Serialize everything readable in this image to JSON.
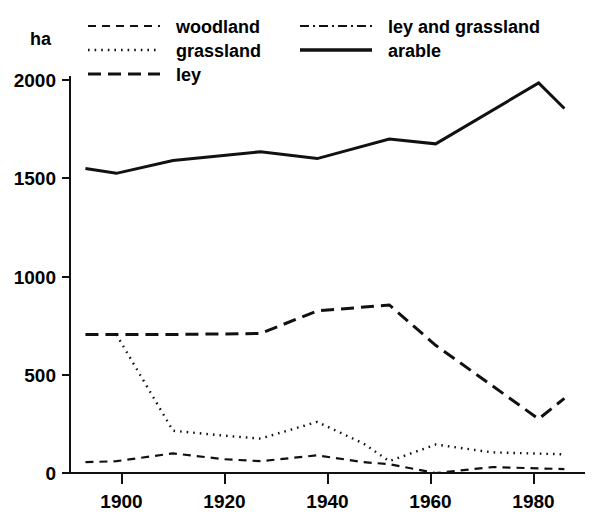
{
  "figure": {
    "y_unit_label": "ha",
    "background_color": "#ffffff",
    "ink_color": "#111111"
  },
  "legend": {
    "position": "top",
    "entries": [
      {
        "key": "woodland",
        "label": "woodland",
        "style": "short-dash",
        "column": 1,
        "row": 1
      },
      {
        "key": "grassland",
        "label": "grassland",
        "style": "dotted",
        "column": 1,
        "row": 2
      },
      {
        "key": "ley",
        "label": "ley",
        "style": "long-dash",
        "column": 1,
        "row": 3
      },
      {
        "key": "ley_and_grassland",
        "label": "ley and grassland",
        "style": "dash-dot",
        "column": 2,
        "row": 1
      },
      {
        "key": "arable",
        "label": "arable",
        "style": "solid",
        "column": 2,
        "row": 2
      }
    ]
  },
  "axes": {
    "y": {
      "label": "ha",
      "ticks": [
        0,
        500,
        1000,
        1500,
        2000
      ],
      "tick_labels": [
        "0",
        "500",
        "1000",
        "1500",
        "2000"
      ],
      "range": [
        0,
        2100
      ]
    },
    "x": {
      "ticks": [
        1900,
        1920,
        1940,
        1960,
        1980
      ],
      "tick_labels": [
        "1900",
        "1920",
        "1940",
        "1960",
        "1980"
      ],
      "range": [
        1890,
        1990
      ]
    },
    "grid": false
  },
  "chart_data": {
    "type": "line",
    "title": "",
    "subtitle": "",
    "xlabel": "",
    "ylabel": "ha",
    "xlim": [
      1890,
      1990
    ],
    "ylim": [
      0,
      2100
    ],
    "grid": false,
    "legend_position": "top",
    "x_tick_labels": [
      "1900",
      "1920",
      "1940",
      "1960",
      "1980"
    ],
    "y_tick_labels": [
      "0",
      "500",
      "1000",
      "1500",
      "2000"
    ],
    "series": [
      {
        "name": "arable",
        "style": "solid",
        "x": [
          1893,
          1899,
          1910,
          1927,
          1938,
          1952,
          1961,
          1981,
          1986
        ],
        "values": [
          1550,
          1525,
          1590,
          1635,
          1600,
          1700,
          1675,
          1985,
          1855
        ]
      },
      {
        "name": "ley",
        "style": "long-dash",
        "x": [
          1893,
          1899,
          1910,
          1927,
          1938,
          1952,
          1961,
          1981,
          1986
        ],
        "values": [
          705,
          705,
          705,
          710,
          825,
          855,
          650,
          275,
          380
        ]
      },
      {
        "name": "grassland",
        "style": "dotted",
        "x": [
          1899,
          1910,
          1920,
          1927,
          1938,
          1947,
          1952,
          1961,
          1972,
          1986
        ],
        "values": [
          705,
          215,
          190,
          175,
          260,
          150,
          60,
          145,
          105,
          95
        ]
      },
      {
        "name": "woodland",
        "style": "short-dash",
        "x": [
          1893,
          1899,
          1910,
          1920,
          1927,
          1938,
          1947,
          1952,
          1961,
          1972,
          1986
        ],
        "values": [
          55,
          60,
          100,
          70,
          60,
          90,
          55,
          45,
          0,
          30,
          20
        ]
      },
      {
        "name": "ley and grassland",
        "style": "dash-dot",
        "x": [],
        "values": []
      }
    ]
  }
}
